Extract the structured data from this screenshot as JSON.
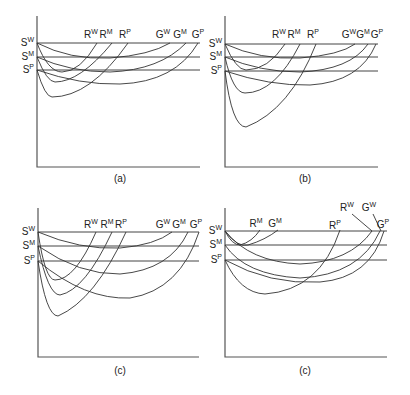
{
  "figure": {
    "panels": [
      {
        "id": "a",
        "caption": "(a)",
        "caption_pos": [
          120,
          182
        ],
        "origin": [
          37,
          167
        ],
        "axis_top": 16,
        "axis_right": 200,
        "levels": [
          {
            "base": "S",
            "sup": "W",
            "y": 43
          },
          {
            "base": "S",
            "sup": "M",
            "y": 57
          },
          {
            "base": "S",
            "sup": "P",
            "y": 70
          }
        ],
        "hline_end": 200,
        "top_labels": [
          {
            "base": "R",
            "sup": "W",
            "x": 91,
            "y": 38
          },
          {
            "base": "R",
            "sup": "M",
            "x": 106,
            "y": 38
          },
          {
            "base": "R",
            "sup": "P",
            "x": 125,
            "y": 38
          },
          {
            "base": "G",
            "sup": "W",
            "x": 163,
            "y": 38
          },
          {
            "base": "G",
            "sup": "M",
            "x": 180,
            "y": 38
          },
          {
            "base": "G",
            "sup": "P",
            "x": 198,
            "y": 38
          }
        ],
        "curves": [
          "M37,43 Q48,72 62,72 Q80,72 97,43",
          "M37,57 Q47,82 55,82 Q80,82 112,43",
          "M37,70 Q45,97 52,97 Q90,97 128,43",
          "M37,43 Q70,60 110,58 Q150,55 170,43",
          "M37,57 Q70,72 110,72 Q160,70 186,43",
          "M37,70 Q80,85 120,84 Q175,82 198,43"
        ]
      },
      {
        "id": "b",
        "caption": "(b)",
        "caption_pos": [
          305,
          182
        ],
        "origin": [
          225,
          167
        ],
        "axis_top": 16,
        "axis_right": 378,
        "levels": [
          {
            "base": "S",
            "sup": "W",
            "y": 44
          },
          {
            "base": "S",
            "sup": "M",
            "y": 57
          },
          {
            "base": "S",
            "sup": "P",
            "y": 71
          }
        ],
        "hline_end": 378,
        "top_labels": [
          {
            "base": "R",
            "sup": "W",
            "x": 279,
            "y": 38
          },
          {
            "base": "R",
            "sup": "M",
            "x": 294,
            "y": 38
          },
          {
            "base": "R",
            "sup": "P",
            "x": 313,
            "y": 38
          },
          {
            "base": "G",
            "sup": "W",
            "x": 349,
            "y": 38
          },
          {
            "base": "G",
            "sup": "M",
            "x": 363,
            "y": 38
          },
          {
            "base": "G",
            "sup": "P",
            "x": 377,
            "y": 38
          }
        ],
        "curves": [
          "M225,44 Q236,70 246,70 Q268,70 285,44",
          "M225,57 Q233,93 245,93 Q275,93 300,44",
          "M225,71 Q232,127 246,127 Q290,110 316,44",
          "M225,44 Q260,60 300,58 Q340,55 355,44",
          "M225,57 Q260,72 300,72 Q350,70 368,44",
          "M225,71 Q270,86 310,85 Q360,82 376,44"
        ]
      },
      {
        "id": "c1",
        "caption": "(c)",
        "caption_pos": [
          120,
          374
        ],
        "origin": [
          38,
          357
        ],
        "axis_top": 208,
        "axis_right": 199,
        "levels": [
          {
            "base": "S",
            "sup": "W",
            "y": 232
          },
          {
            "base": "S",
            "sup": "M",
            "y": 246
          },
          {
            "base": "S",
            "sup": "P",
            "y": 261
          }
        ],
        "hline_end": 199,
        "top_labels": [
          {
            "base": "R",
            "sup": "W",
            "x": 91,
            "y": 228
          },
          {
            "base": "R",
            "sup": "M",
            "x": 107,
            "y": 228
          },
          {
            "base": "R",
            "sup": "P",
            "x": 121,
            "y": 228
          },
          {
            "base": "G",
            "sup": "W",
            "x": 163,
            "y": 228
          },
          {
            "base": "G",
            "sup": "M",
            "x": 179,
            "y": 228
          },
          {
            "base": "G",
            "sup": "P",
            "x": 196,
            "y": 228
          }
        ],
        "curves": [
          "M38,232 Q45,280 55,280 Q75,280 96,232",
          "M38,246 Q48,295 60,295 Q85,290 112,232",
          "M38,261 Q46,316 58,316 Q95,300 126,232",
          "M38,232 Q80,250 120,248 Q155,245 172,232",
          "M38,246 Q80,275 120,274 Q170,270 188,232",
          "M38,261 Q85,300 130,298 Q180,290 199,232"
        ]
      },
      {
        "id": "c2",
        "caption": "(c)",
        "caption_pos": [
          305,
          374
        ],
        "origin": [
          225,
          357
        ],
        "axis_top": 208,
        "axis_right": 387,
        "levels": [
          {
            "base": "S",
            "sup": "W",
            "y": 231
          },
          {
            "base": "S",
            "sup": "M",
            "y": 245
          },
          {
            "base": "S",
            "sup": "P",
            "y": 260
          }
        ],
        "hline_end": 387,
        "top_labels": [
          {
            "base": "R",
            "sup": "M",
            "x": 256,
            "y": 227
          },
          {
            "base": "G",
            "sup": "M",
            "x": 275,
            "y": 227
          },
          {
            "base": "R",
            "sup": "P",
            "x": 335,
            "y": 229
          },
          {
            "base": "R",
            "sup": "W",
            "x": 347,
            "y": 211
          },
          {
            "base": "G",
            "sup": "W",
            "x": 369,
            "y": 211
          },
          {
            "base": "G",
            "sup": "P",
            "x": 383,
            "y": 228
          }
        ],
        "leaders": [
          "M352,214 L372,231",
          "M373,214 L381,231"
        ],
        "curves": [
          "M225,231 Q232,245 240,245 Q252,242 260,230",
          "M225,231 Q238,248 248,245 Q265,240 278,230",
          "M225,231 Q250,262 300,264 Q350,262 372,231",
          "M225,245 Q245,275 300,278 Q360,275 380,231",
          "M225,260 Q240,293 265,294 Q320,290 340,230",
          "M225,260 Q270,285 320,282 Q370,278 384,231"
        ]
      }
    ]
  }
}
